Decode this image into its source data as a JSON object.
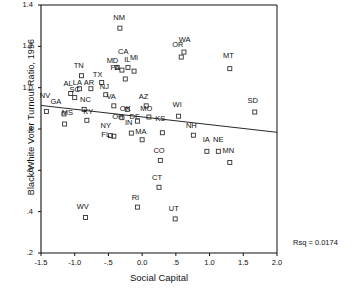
{
  "chart_data": {
    "type": "scatter",
    "title": "",
    "xlabel": "Social Capital",
    "ylabel": "Black/White Voter Turnout Ratio, 1996",
    "xlim": [
      -1.5,
      2.0
    ],
    "ylim": [
      0.2,
      1.4
    ],
    "xticks": [
      "-1.5",
      "-1.0",
      "-.5",
      "0.0",
      ".5",
      "1.0",
      "1.5",
      "2.0"
    ],
    "xtick_values": [
      -1.5,
      -1.0,
      -0.5,
      0.0,
      0.5,
      1.0,
      1.5,
      2.0
    ],
    "yticks": [
      "1.4",
      "1.2",
      "1.0",
      ".8",
      ".6",
      ".4",
      ".2"
    ],
    "ytick_values": [
      1.4,
      1.2,
      1.0,
      0.8,
      0.6,
      0.4,
      0.2
    ],
    "grid": false,
    "legend": false,
    "annotation": "Rsq = 0.0174",
    "rsq": 0.0174,
    "fit_line": {
      "type": "linear-regression",
      "x0": -1.5,
      "y0": 0.914,
      "x1": 2.0,
      "y1": 0.784
    },
    "point_marker": "open-square",
    "points": [
      {
        "label": "NV",
        "x": -1.42,
        "y": 0.885,
        "lx": -1.44,
        "ly": 0.955
      },
      {
        "label": "GA",
        "x": -1.16,
        "y": 0.873,
        "lx": -1.28,
        "ly": 0.925
      },
      {
        "label": "MS",
        "x": -1.15,
        "y": 0.824,
        "lx": -1.11,
        "ly": 0.872
      },
      {
        "label": "AL",
        "x": -1.06,
        "y": 0.972,
        "lx": -1.1,
        "ly": 1.012
      },
      {
        "label": "SC",
        "x": -1.0,
        "y": 0.952,
        "lx": -1.0,
        "ly": 0.985
      },
      {
        "label": "LA",
        "x": -0.93,
        "y": 0.995,
        "lx": -0.96,
        "ly": 1.018
      },
      {
        "label": "TN",
        "x": -0.9,
        "y": 1.058,
        "lx": -0.94,
        "ly": 1.098
      },
      {
        "label": "NC",
        "x": -0.86,
        "y": 0.895,
        "lx": -0.84,
        "ly": 0.935
      },
      {
        "label": "KY",
        "x": -0.82,
        "y": 0.842,
        "lx": -0.8,
        "ly": 0.876
      },
      {
        "label": "AR",
        "x": -0.76,
        "y": 0.995,
        "lx": -0.79,
        "ly": 1.018
      },
      {
        "label": "WV",
        "x": -0.84,
        "y": 0.372,
        "lx": -0.88,
        "ly": 0.418
      },
      {
        "label": "TX",
        "x": -0.6,
        "y": 1.025,
        "lx": -0.66,
        "ly": 1.058
      },
      {
        "label": "NJ",
        "x": -0.54,
        "y": 0.966,
        "lx": -0.56,
        "ly": 1.0
      },
      {
        "label": "NY",
        "x": -0.47,
        "y": 0.768,
        "lx": -0.54,
        "ly": 0.81
      },
      {
        "label": "FL",
        "x": -0.42,
        "y": 0.765,
        "lx": -0.54,
        "ly": 0.765
      },
      {
        "label": "VA",
        "x": -0.42,
        "y": 0.912,
        "lx": -0.46,
        "ly": 0.948
      },
      {
        "label": "MD",
        "x": -0.37,
        "y": 1.098,
        "lx": -0.44,
        "ly": 1.125
      },
      {
        "label": "PA",
        "x": -0.3,
        "y": 1.085,
        "lx": -0.4,
        "ly": 1.09
      },
      {
        "label": "NM",
        "x": -0.33,
        "y": 1.288,
        "lx": -0.34,
        "ly": 1.33
      },
      {
        "label": "OH",
        "x": -0.3,
        "y": 0.855,
        "lx": -0.36,
        "ly": 0.855
      },
      {
        "label": "CA",
        "x": -0.25,
        "y": 1.042,
        "lx": -0.28,
        "ly": 1.17
      },
      {
        "label": "IL",
        "x": -0.21,
        "y": 1.098,
        "lx": -0.22,
        "ly": 1.13
      },
      {
        "label": "OK",
        "x": -0.22,
        "y": 0.895,
        "lx": -0.25,
        "ly": 0.892
      },
      {
        "label": "IN",
        "x": -0.16,
        "y": 0.78,
        "lx": -0.2,
        "ly": 0.822
      },
      {
        "label": "MI",
        "x": -0.12,
        "y": 1.08,
        "lx": -0.12,
        "ly": 1.138
      },
      {
        "label": "DE",
        "x": -0.07,
        "y": 0.838,
        "lx": -0.11,
        "ly": 0.852
      },
      {
        "label": "AZ",
        "x": 0.06,
        "y": 0.912,
        "lx": 0.02,
        "ly": 0.95
      },
      {
        "label": "MA",
        "x": 0.0,
        "y": 0.748,
        "lx": -0.02,
        "ly": 0.782
      },
      {
        "label": "MO",
        "x": 0.1,
        "y": 0.858,
        "lx": 0.06,
        "ly": 0.89
      },
      {
        "label": "RI",
        "x": -0.07,
        "y": 0.422,
        "lx": -0.1,
        "ly": 0.462
      },
      {
        "label": "CT",
        "x": 0.25,
        "y": 0.518,
        "lx": 0.22,
        "ly": 0.56
      },
      {
        "label": "CO",
        "x": 0.27,
        "y": 0.648,
        "lx": 0.25,
        "ly": 0.69
      },
      {
        "label": "KS",
        "x": 0.3,
        "y": 0.782,
        "lx": 0.27,
        "ly": 0.845
      },
      {
        "label": "UT",
        "x": 0.49,
        "y": 0.365,
        "lx": 0.47,
        "ly": 0.408
      },
      {
        "label": "WI",
        "x": 0.54,
        "y": 0.862,
        "lx": 0.52,
        "ly": 0.91
      },
      {
        "label": "OR",
        "x": 0.58,
        "y": 1.148,
        "lx": 0.53,
        "ly": 1.2
      },
      {
        "label": "WA",
        "x": 0.62,
        "y": 1.172,
        "lx": 0.63,
        "ly": 1.225
      },
      {
        "label": "NH",
        "x": 0.76,
        "y": 0.77,
        "lx": 0.73,
        "ly": 0.812
      },
      {
        "label": "IA",
        "x": 0.96,
        "y": 0.692,
        "lx": 0.95,
        "ly": 0.742
      },
      {
        "label": "NE",
        "x": 1.13,
        "y": 0.692,
        "lx": 1.13,
        "ly": 0.742
      },
      {
        "label": "MT",
        "x": 1.3,
        "y": 1.092,
        "lx": 1.28,
        "ly": 1.148
      },
      {
        "label": "MN",
        "x": 1.3,
        "y": 0.638,
        "lx": 1.28,
        "ly": 0.69
      },
      {
        "label": "SD",
        "x": 1.67,
        "y": 0.882,
        "lx": 1.64,
        "ly": 0.93
      }
    ]
  }
}
